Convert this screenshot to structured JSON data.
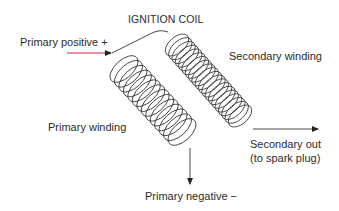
{
  "title": "IGNITION COIL",
  "labels": {
    "primary_positive": "Primary positive +",
    "secondary_winding": "Secondary winding",
    "primary_winding": "Primary winding",
    "secondary_out_line1": "Secondary out",
    "secondary_out_line2": "(to spark plug)",
    "primary_negative": "Primary negative −"
  },
  "colors": {
    "wire": "#333333",
    "input_lead": "#d0203a",
    "text": "#2b2b2b",
    "background": "#ffffff"
  },
  "components": {
    "primary_coil": {
      "turns": 14,
      "axis": "diagonal down-right"
    },
    "secondary_coil": {
      "turns": 20,
      "axis": "diagonal down-right"
    }
  }
}
